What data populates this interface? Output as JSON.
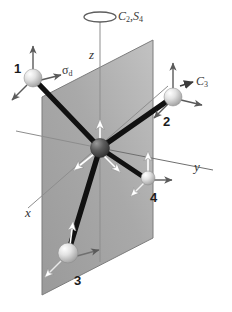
{
  "figure": {
    "background_color": "#ffffff",
    "plane_color": "#a8a8a8",
    "bond_color": "#111111",
    "atom_light_color": "#d8d8d8",
    "atom_center_color": "#4a4a4a",
    "arrow_dark_color": "#555555",
    "arrow_white_color": "#ffffff"
  },
  "labels": {
    "axis_z": "z",
    "axis_y": "y",
    "axis_x": "x",
    "rotation_axis": "C",
    "rotation_axis_sub": "2",
    "improper_axis": "S",
    "improper_axis_sub": "4",
    "rotation_combo": "C₂,S₄",
    "mirror_plane": "σ",
    "mirror_plane_sub": "d",
    "c3_axis": "C",
    "c3_axis_sub": "3",
    "atom_1": "1",
    "atom_2": "2",
    "atom_3": "3",
    "atom_4": "4"
  },
  "atoms": [
    {
      "id": "1",
      "label": "1",
      "x": 33,
      "y": 78,
      "r": 9,
      "type": "ligand"
    },
    {
      "id": "2",
      "label": "2",
      "x": 173,
      "y": 97,
      "r": 9,
      "type": "ligand"
    },
    {
      "id": "3",
      "label": "3",
      "x": 68,
      "y": 253,
      "r": 10,
      "type": "ligand"
    },
    {
      "id": "4",
      "label": "4",
      "x": 148,
      "y": 178,
      "r": 7,
      "type": "ligand"
    },
    {
      "id": "C",
      "label": "",
      "x": 100,
      "y": 148,
      "r": 9,
      "type": "center"
    }
  ],
  "plane": {
    "name": "sigma-d mirror plane",
    "points": "42,97 153,40 153,238 42,295"
  },
  "axes": [
    {
      "name": "z-axis",
      "label": "z"
    },
    {
      "name": "y-axis",
      "label": "y"
    },
    {
      "name": "x-axis",
      "label": "x"
    }
  ]
}
